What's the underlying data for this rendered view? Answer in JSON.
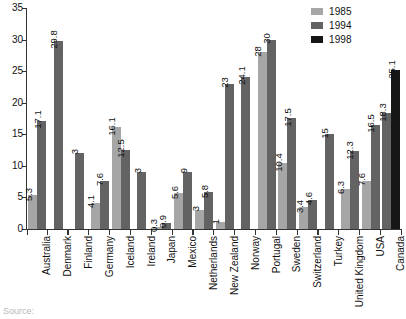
{
  "chart_data": {
    "type": "bar",
    "title": "",
    "subtitle": "",
    "xlabel": "",
    "ylabel": "",
    "ylim": [
      0,
      35
    ],
    "yticks": [
      0,
      5,
      10,
      15,
      20,
      25,
      30,
      35
    ],
    "grid": false,
    "legend_position": "top-right",
    "categories": [
      "Australia",
      "Denmark",
      "Finland",
      "Germany",
      "Iceland",
      "Ireland",
      "Japan",
      "Mexico",
      "Netherlands",
      "New Zealand",
      "Norway",
      "Portugal",
      "Sweden",
      "Switzerland",
      "Turkey",
      "United Kingdom",
      "USA",
      "Canada"
    ],
    "series": [
      {
        "name": "1985",
        "color": "#a6a6a6",
        "values": [
          5.3,
          null,
          null,
          4.1,
          16.1,
          null,
          0.3,
          5.6,
          3,
          1,
          null,
          28,
          10.4,
          3.4,
          null,
          6.3,
          7.6,
          null
        ]
      },
      {
        "name": "1994",
        "color": "#636363",
        "values": [
          17.1,
          29.8,
          12,
          7.6,
          12.5,
          9,
          0.9,
          9,
          5.8,
          23,
          24.1,
          30,
          17.5,
          4.6,
          15,
          12.3,
          16.5,
          18.3
        ]
      },
      {
        "name": "1998",
        "color": "#161616",
        "values": [
          null,
          null,
          null,
          null,
          null,
          null,
          null,
          null,
          null,
          null,
          null,
          null,
          null,
          null,
          null,
          null,
          null,
          25.1
        ]
      }
    ],
    "bar_labels": {
      "Australia": [
        "5.3",
        "17.1"
      ],
      "Denmark": [
        "29.8"
      ],
      "Finland": [
        "3",
        "12"
      ],
      "Germany": [
        "4.1",
        "7.6"
      ],
      "Iceland": [
        "16.1",
        "12.5"
      ],
      "Ireland": [
        "3",
        "9"
      ],
      "Japan": [
        "0.3",
        "0.9"
      ],
      "Mexico": [
        "5.6",
        "9"
      ],
      "Netherlands": [
        "3",
        "5.8"
      ],
      "New Zealand": [
        "1",
        "23"
      ],
      "Norway": [
        "24.1"
      ],
      "Portugal": [
        "28",
        "30"
      ],
      "Sweden": [
        "10.4",
        "17.5"
      ],
      "Switzerland": [
        "3.4",
        "4.6"
      ],
      "Turkey": [
        "15"
      ],
      "United Kingdom": [
        "6.3",
        "12.3"
      ],
      "USA": [
        "7.6",
        "16.5"
      ],
      "Canada": [
        "18.3",
        "25.1"
      ]
    }
  },
  "legend": {
    "items": [
      {
        "label": "1985",
        "color": "#a6a6a6"
      },
      {
        "label": "1994",
        "color": "#636363"
      },
      {
        "label": "1998",
        "color": "#161616"
      }
    ]
  },
  "footer": {
    "source_text": "Source:"
  }
}
